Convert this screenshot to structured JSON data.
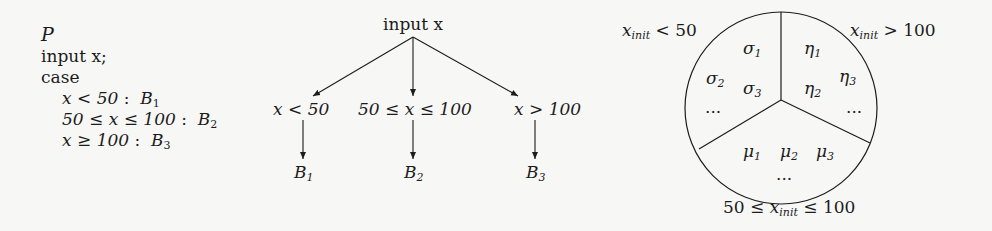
{
  "program": {
    "name": "P",
    "lines": [
      "input x;",
      "case"
    ],
    "cases": [
      {
        "cond": "x < 50",
        "block": "B",
        "block_sub": "1"
      },
      {
        "cond": "50 ≤ x ≤ 100",
        "block": "B",
        "block_sub": "2"
      },
      {
        "cond": "x ≥ 100",
        "block": "B",
        "block_sub": "3"
      }
    ]
  },
  "tree": {
    "root": "input x",
    "branches": [
      {
        "cond": "x < 50",
        "block": "B",
        "block_sub": "1"
      },
      {
        "cond": "50 ≤ x ≤ 100",
        "block": "B",
        "block_sub": "2"
      },
      {
        "cond": "x > 100",
        "block": "B",
        "block_sub": "3"
      }
    ]
  },
  "partition": {
    "labels": {
      "left": {
        "var": "x",
        "sub": "init",
        "rel": " < 50"
      },
      "right": {
        "var": "x",
        "sub": "init",
        "rel": " > 100"
      },
      "bottom": {
        "pre": "50 ≤ ",
        "var": "x",
        "sub": "init",
        "rel": " ≤ 100"
      }
    },
    "regions": {
      "sigma": {
        "sym": "σ",
        "items": [
          "1",
          "2",
          "3"
        ],
        "ellipsis": "···"
      },
      "eta": {
        "sym": "η",
        "items": [
          "1",
          "2",
          "3"
        ],
        "ellipsis": "···"
      },
      "mu": {
        "sym": "μ",
        "items": [
          "1",
          "2",
          "3"
        ],
        "ellipsis": "···"
      }
    }
  }
}
